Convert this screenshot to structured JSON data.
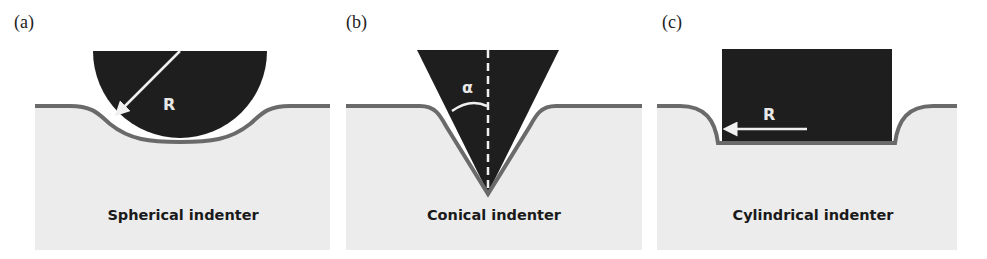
{
  "figure": {
    "panels": [
      {
        "id": "a",
        "label": "(a)",
        "caption": "Spherical indenter",
        "dimension_symbol": "R",
        "shape": "sphere"
      },
      {
        "id": "b",
        "label": "(b)",
        "caption": "Conical indenter",
        "dimension_symbol": "α",
        "shape": "cone"
      },
      {
        "id": "c",
        "label": "(c)",
        "caption": "Cylindrical indenter",
        "dimension_symbol": "R",
        "shape": "cylinder"
      }
    ],
    "colors": {
      "indenter": "#1e1e1e",
      "substrate": "#ececec",
      "surface_line": "#6a6a6a",
      "annotation": "#f0f0f0"
    }
  }
}
